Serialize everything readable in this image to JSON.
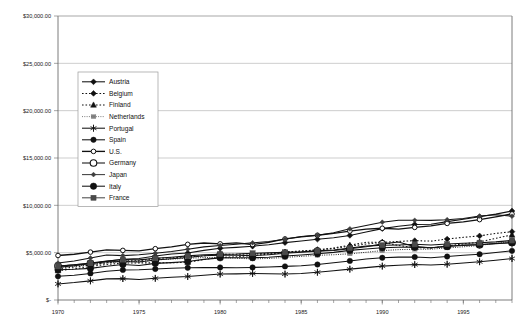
{
  "chart_data": {
    "type": "line",
    "title": "",
    "subtitle": "",
    "xlabel": "",
    "ylabel": "",
    "xlim": [
      1970,
      1998
    ],
    "ylim": [
      0,
      30000
    ],
    "grid": true,
    "grid_axis": "y",
    "legend_position": "upper-left-inside",
    "y_ticks": [
      0,
      5000,
      10000,
      15000,
      20000,
      25000,
      30000
    ],
    "y_tick_labels": [
      "$-",
      "$5,000.00",
      "$10,000.00",
      "$15,000.00",
      "$20,000.00",
      "$25,000.00",
      "$30,000.00"
    ],
    "x_ticks": [
      1970,
      1975,
      1980,
      1985,
      1990,
      1995
    ],
    "x_tick_labels": [
      "1970",
      "1975",
      "1980",
      "1985",
      "1990",
      "1995"
    ],
    "x_minor_tick_interval": 1,
    "x": [
      1970,
      1971,
      1972,
      1973,
      1974,
      1975,
      1976,
      1977,
      1978,
      1979,
      1980,
      1981,
      1982,
      1983,
      1984,
      1985,
      1986,
      1987,
      1988,
      1989,
      1990,
      1991,
      1992,
      1993,
      1994,
      1995,
      1996,
      1997,
      1998
    ],
    "series": [
      {
        "name": "Austria",
        "marker": "filled-diamond",
        "line_style": "solid",
        "color": "#111111",
        "values": [
          3450,
          3620,
          3850,
          4080,
          4300,
          4380,
          4640,
          4860,
          4960,
          5240,
          5460,
          5560,
          5680,
          5840,
          6060,
          6230,
          6420,
          6580,
          6820,
          7180,
          7540,
          7800,
          7980,
          8010,
          8280,
          8520,
          8790,
          9070,
          9400
        ]
      },
      {
        "name": "Belgium",
        "marker": "filled-diamond",
        "line_style": "dotted",
        "color": "#111111",
        "values": [
          3300,
          3480,
          3700,
          3930,
          4140,
          4150,
          4400,
          4450,
          4570,
          4660,
          4840,
          4830,
          4870,
          4930,
          5080,
          5180,
          5300,
          5430,
          5690,
          5910,
          6090,
          6190,
          6270,
          6220,
          6440,
          6620,
          6770,
          7030,
          7220
        ]
      },
      {
        "name": "Finland",
        "marker": "filled-triangle",
        "line_style": "dotted",
        "color": "#111111",
        "values": [
          3100,
          3280,
          3530,
          3760,
          3890,
          3920,
          3920,
          3930,
          3990,
          4270,
          4500,
          4570,
          4700,
          4840,
          5000,
          5160,
          5290,
          5500,
          5800,
          6090,
          6110,
          5760,
          5530,
          5480,
          5700,
          5920,
          6130,
          6520,
          6870
        ]
      },
      {
        "name": "Netherlands",
        "marker": "dash-cluster",
        "line_style": "dashed-fine",
        "color": "#6e6e6e",
        "values": [
          3400,
          3580,
          3730,
          3920,
          4080,
          4050,
          4230,
          4320,
          4410,
          4480,
          4510,
          4410,
          4340,
          4390,
          4500,
          4610,
          4720,
          4780,
          4880,
          5040,
          5220,
          5320,
          5360,
          5370,
          5500,
          5620,
          5760,
          6000,
          6220
        ]
      },
      {
        "name": "Portugal",
        "marker": "asterisk",
        "line_style": "solid",
        "color": "#111111",
        "values": [
          1700,
          1840,
          2020,
          2230,
          2260,
          2160,
          2290,
          2410,
          2480,
          2610,
          2740,
          2760,
          2800,
          2780,
          2740,
          2800,
          2930,
          3100,
          3260,
          3420,
          3580,
          3680,
          3740,
          3700,
          3780,
          3900,
          4040,
          4200,
          4380
        ]
      },
      {
        "name": "Spain",
        "marker": "filled-circle",
        "line_style": "solid",
        "color": "#111111",
        "values": [
          2500,
          2610,
          2810,
          3040,
          3180,
          3200,
          3280,
          3360,
          3400,
          3420,
          3440,
          3410,
          3440,
          3490,
          3550,
          3620,
          3750,
          3930,
          4130,
          4320,
          4460,
          4530,
          4540,
          4470,
          4590,
          4720,
          4830,
          5010,
          5190
        ]
      },
      {
        "name": "U.S.",
        "marker": "open-circle-small",
        "line_style": "solid-thick",
        "color": "#111111",
        "values": [
          4700,
          4830,
          5060,
          5300,
          5240,
          5190,
          5420,
          5620,
          5880,
          6020,
          5930,
          6040,
          5860,
          6080,
          6450,
          6660,
          6840,
          7030,
          7280,
          7490,
          7580,
          7490,
          7670,
          7830,
          8090,
          8250,
          8490,
          8790,
          9090
        ]
      },
      {
        "name": "Germany",
        "marker": "open-circle-large",
        "line_style": "solid",
        "color": "#111111",
        "values": [
          3600,
          3710,
          3860,
          4030,
          4060,
          4010,
          4230,
          4360,
          4500,
          4680,
          4740,
          4730,
          4690,
          4780,
          4930,
          5040,
          5160,
          5230,
          5410,
          5620,
          5930,
          6120,
          5640,
          5530,
          5680,
          5760,
          5830,
          5940,
          6070
        ]
      },
      {
        "name": "Japan",
        "marker": "filled-diamond-small",
        "line_style": "solid",
        "color": "#3d3d3d",
        "values": [
          3900,
          4120,
          4440,
          4760,
          4690,
          4780,
          4940,
          5130,
          5370,
          5610,
          5750,
          5900,
          6040,
          6170,
          6420,
          6700,
          6830,
          7100,
          7520,
          7860,
          8220,
          8420,
          8420,
          8410,
          8480,
          8610,
          8870,
          9000,
          8850
        ]
      },
      {
        "name": "Italy",
        "marker": "filled-circle-large",
        "line_style": "solid",
        "color": "#111111",
        "values": [
          3200,
          3240,
          3340,
          3570,
          3750,
          3640,
          3870,
          3950,
          4060,
          4290,
          4450,
          4460,
          4470,
          4510,
          4640,
          4760,
          4880,
          5030,
          5240,
          5390,
          5520,
          5570,
          5590,
          5520,
          5650,
          5820,
          5870,
          5970,
          6060
        ]
      },
      {
        "name": "France",
        "marker": "filled-square",
        "line_style": "solid",
        "color": "#4a4a4a",
        "values": [
          3550,
          3730,
          3910,
          4110,
          4270,
          4240,
          4410,
          4520,
          4660,
          4790,
          4840,
          4850,
          4940,
          4980,
          5030,
          5090,
          5190,
          5290,
          5490,
          5690,
          5790,
          5820,
          5880,
          5810,
          5910,
          5990,
          6050,
          6140,
          6290
        ]
      }
    ]
  },
  "legend": {
    "items": [
      {
        "label": "Austria"
      },
      {
        "label": "Belgium"
      },
      {
        "label": "Finland"
      },
      {
        "label": "Netherlands"
      },
      {
        "label": "Portugal"
      },
      {
        "label": "Spain"
      },
      {
        "label": "U.S."
      },
      {
        "label": "Germany"
      },
      {
        "label": "Japan"
      },
      {
        "label": "Italy"
      },
      {
        "label": "France"
      }
    ]
  },
  "colors": {
    "background": "#ffffff",
    "grid": "#9b9b9b",
    "axis": "#5a5a5a",
    "text": "#1a1a1a",
    "series_default": "#111111"
  }
}
